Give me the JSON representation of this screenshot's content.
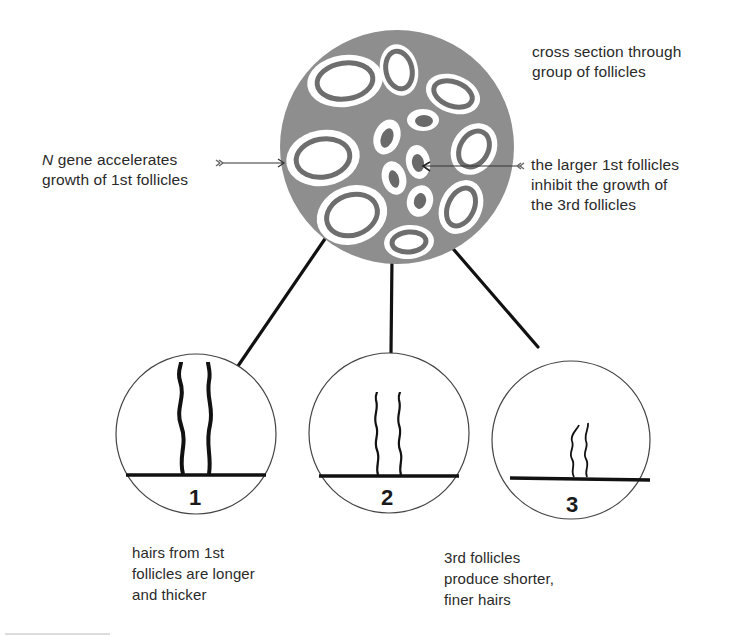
{
  "labels": {
    "cross_section": [
      "cross section through",
      "group of follicles"
    ],
    "n_gene": {
      "italic": "N",
      "rest": " gene accelerates",
      "line2": "growth of 1st follicles"
    },
    "inhibit": [
      "the larger 1st follicles",
      "inhibit the growth of",
      "the 3rd follicles"
    ],
    "caption_1": [
      "hairs from 1st",
      "follicles are longer",
      "and thicker"
    ],
    "caption_3": [
      "3rd follicles",
      "produce shorter,",
      "finer hairs"
    ]
  },
  "circles": [
    {
      "number": "1",
      "hair": "long thick hairs"
    },
    {
      "number": "2",
      "hair": "medium hairs"
    },
    {
      "number": "3",
      "hair": "short fine hairs"
    }
  ],
  "colors": {
    "section_fill": "#8e8e8e",
    "follicle_ring": "#6e6e6e",
    "follicle_white": "#ffffff",
    "inner_core": "#6a6a6a",
    "line": "#111111"
  }
}
